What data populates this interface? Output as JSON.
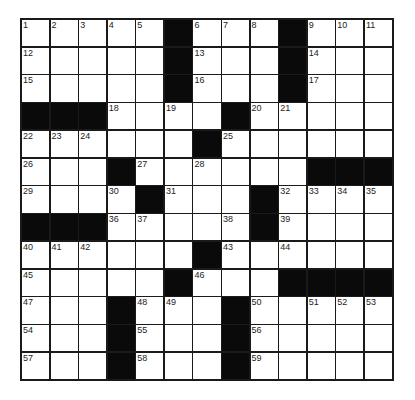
{
  "puzzle": {
    "rows": 13,
    "cols": 13,
    "grid": [
      [
        "1",
        "2",
        "3",
        "4",
        "5",
        "#",
        "6",
        "7",
        "8",
        "#",
        "9",
        "10",
        "11"
      ],
      [
        "12",
        "",
        "",
        "",
        "",
        "#",
        "13",
        "",
        "",
        "#",
        "14",
        "",
        ""
      ],
      [
        "15",
        "",
        "",
        "",
        "",
        "#",
        "16",
        "",
        "",
        "#",
        "17",
        "",
        ""
      ],
      [
        "#",
        "#",
        "#",
        "18",
        "",
        "19",
        "",
        "#",
        "20",
        "21",
        "",
        "",
        ""
      ],
      [
        "22",
        "23",
        "24",
        "",
        "",
        "",
        "#",
        "25",
        "",
        "",
        "",
        "",
        ""
      ],
      [
        "26",
        "",
        "",
        "#",
        "27",
        "",
        "28",
        "",
        "",
        "",
        "#",
        "#",
        "#"
      ],
      [
        "29",
        "",
        "",
        "30",
        "#",
        "31",
        "",
        "",
        "#",
        "32",
        "33",
        "34",
        "35"
      ],
      [
        "#",
        "#",
        "#",
        "36",
        "37",
        "",
        "",
        "38",
        "#",
        "39",
        "",
        "",
        ""
      ],
      [
        "40",
        "41",
        "42",
        "",
        "",
        "",
        "#",
        "43",
        "",
        "44",
        "",
        "",
        ""
      ],
      [
        "45",
        "",
        "",
        "",
        "",
        "#",
        "46",
        "",
        "",
        "#",
        "#",
        "#",
        "#"
      ],
      [
        "47",
        "",
        "",
        "#",
        "48",
        "49",
        "",
        "#",
        "50",
        "",
        "51",
        "52",
        "53"
      ],
      [
        "54",
        "",
        "",
        "#",
        "55",
        "",
        "",
        "#",
        "56",
        "",
        "",
        "",
        ""
      ],
      [
        "57",
        "",
        "",
        "#",
        "58",
        "",
        "",
        "#",
        "59",
        "",
        "",
        "",
        ""
      ]
    ]
  }
}
